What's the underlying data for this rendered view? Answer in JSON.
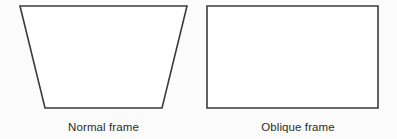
{
  "figure": {
    "background_color": "#fbfbfb",
    "stroke_color": "#3b3b3b",
    "fill_color": "#ffffff",
    "text_color": "#2b2b2b",
    "shapes": [
      {
        "name": "normal-frame",
        "kind": "trapezoid",
        "caption": "Normal frame",
        "points": "20,6 187,6 162,108 45,108"
      },
      {
        "name": "oblique-frame",
        "kind": "rectangle",
        "caption": "Oblique frame",
        "points": "207,6 378,6 378,108 207,108"
      }
    ],
    "captions": {
      "left": "Normal frame",
      "right": "Oblique frame"
    }
  }
}
